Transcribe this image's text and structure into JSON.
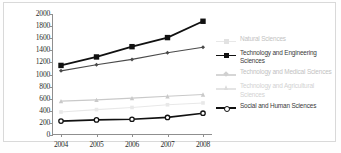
{
  "chart_data": {
    "type": "line",
    "title": "",
    "subtitle": "",
    "xlabel": "",
    "ylabel": "",
    "categories": [
      "2004",
      "2005",
      "2006",
      "2007",
      "2008"
    ],
    "x": [
      2004,
      2005,
      2006,
      2007,
      2008
    ],
    "ylim": [
      0,
      2000
    ],
    "yticks": [
      0,
      200,
      400,
      600,
      800,
      1000,
      1200,
      1400,
      1600,
      1800,
      2000
    ],
    "ytick_labels": [
      "0",
      "200",
      "400",
      "600",
      "800",
      "1000",
      "1200",
      "1400",
      "1600",
      "1800",
      "2000"
    ],
    "grid": false,
    "legend_position": "right",
    "series": [
      {
        "name": "Natural Sciences",
        "marker": "square",
        "color": "#e8e8e8",
        "values": [
          380,
          420,
          455,
          500,
          530
        ]
      },
      {
        "name": "Technology and Engineering Sciences",
        "marker": "square",
        "color": "#111111",
        "values": [
          1150,
          1290,
          1460,
          1610,
          1880
        ]
      },
      {
        "name": "Technology and Medical Sciences",
        "marker": "diamond",
        "color": "#4a4a4a",
        "values": [
          1060,
          1160,
          1250,
          1360,
          1450
        ]
      },
      {
        "name": "Technology and Agricultural Sciences",
        "marker": "triangle",
        "color": "#c9c9c9",
        "values": [
          560,
          580,
          610,
          640,
          670
        ]
      },
      {
        "name": "Social and Human Sciences",
        "marker": "circle",
        "color": "#111111",
        "values": [
          230,
          250,
          260,
          290,
          360
        ]
      }
    ]
  },
  "legend": {
    "entries": [
      {
        "label": "Natural Sciences",
        "style": "faint"
      },
      {
        "label": "Technology and Engineering Sciences",
        "style": "dark"
      },
      {
        "label": "Technology and Medical Sciences",
        "style": "faint"
      },
      {
        "label": "Technology and Agricultural Sciences",
        "style": "faint2"
      },
      {
        "label": "Social and Human Sciences",
        "style": "dark"
      }
    ]
  }
}
